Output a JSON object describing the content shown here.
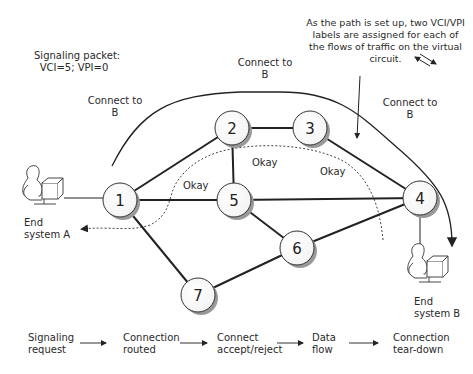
{
  "diagram": {
    "annotations": {
      "signaling_packet": {
        "line1": "Signaling packet:",
        "line2": "VCI=5; VPI=0"
      },
      "connect_left": {
        "line1": "Connect to",
        "line2": "B"
      },
      "connect_top": {
        "line1": "Connect to",
        "line2": "B"
      },
      "connect_right": {
        "line1": "Connect to",
        "line2": "B"
      },
      "vci_note": {
        "line1": "As the path is set up, two VCI/VPI",
        "line2": "labels  are assigned for each of",
        "line3": "the flows of traffic on the virtual",
        "line4": "circuit."
      },
      "okay_1": "Okay",
      "okay_2": "Okay",
      "okay_3": "Okay"
    },
    "nodes": [
      {
        "id": "1",
        "label": "1",
        "x": 120,
        "y": 200
      },
      {
        "id": "2",
        "label": "2",
        "x": 232,
        "y": 128
      },
      {
        "id": "3",
        "label": "3",
        "x": 310,
        "y": 128
      },
      {
        "id": "4",
        "label": "4",
        "x": 420,
        "y": 198
      },
      {
        "id": "5",
        "label": "5",
        "x": 234,
        "y": 200
      },
      {
        "id": "6",
        "label": "6",
        "x": 297,
        "y": 248
      },
      {
        "id": "7",
        "label": "7",
        "x": 198,
        "y": 295
      }
    ],
    "edges": [
      [
        "1",
        "2"
      ],
      [
        "1",
        "5"
      ],
      [
        "1",
        "7"
      ],
      [
        "2",
        "3"
      ],
      [
        "2",
        "5"
      ],
      [
        "3",
        "4"
      ],
      [
        "5",
        "4"
      ],
      [
        "5",
        "6"
      ],
      [
        "6",
        "4"
      ],
      [
        "7",
        "6"
      ]
    ],
    "end_systems": {
      "a": {
        "line1": "End",
        "line2": "system A"
      },
      "b": {
        "line1": "End",
        "line2": "system B"
      }
    },
    "process_steps": [
      {
        "line1": "Signaling",
        "line2": "request"
      },
      {
        "line1": "Connection",
        "line2": "routed"
      },
      {
        "line1": "Connect",
        "line2": "accept/reject"
      },
      {
        "line1": "Data",
        "line2": "flow"
      },
      {
        "line1": "Connection",
        "line2": "tear-down"
      }
    ]
  }
}
